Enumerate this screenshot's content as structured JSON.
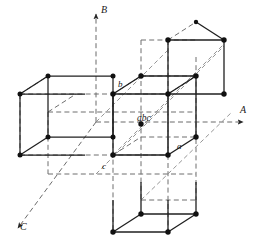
{
  "figure": {
    "type": "crystal-lattice-diagram",
    "background": "#ffffff",
    "line_color": "#1f1f1f",
    "dash_color": "#6b6b6b",
    "vertex_color": "#111111"
  },
  "axes": [
    {
      "id": "A",
      "label": "A",
      "direction": "right",
      "arrow": true
    },
    {
      "id": "B",
      "label": "B",
      "direction": "up",
      "arrow": true
    },
    {
      "id": "C",
      "label": "C",
      "direction": "down-left",
      "arrow": true
    }
  ],
  "point_labels": [
    {
      "id": "a",
      "label": "a",
      "x": 178,
      "y": 146
    },
    {
      "id": "b",
      "label": "b",
      "x": 118,
      "y": 84
    },
    {
      "id": "c",
      "label": "c",
      "x": 102,
      "y": 168
    },
    {
      "id": "abc",
      "label": "abc",
      "x": 136,
      "y": 118
    }
  ],
  "axis_labels": [
    {
      "id": "A",
      "label": "A",
      "x": 240,
      "y": 107
    },
    {
      "id": "B",
      "label": "B",
      "x": 101,
      "y": 7
    },
    {
      "id": "C",
      "label": "C",
      "x": 20,
      "y": 225
    }
  ],
  "cells": [
    {
      "id": "center-cell",
      "role": "origin unit cell"
    },
    {
      "id": "left-cell",
      "role": "cell translated along -A"
    },
    {
      "id": "top-right-cell",
      "role": "cell translated along +B and +A"
    },
    {
      "id": "bottom-cell",
      "role": "cell translated along -B"
    }
  ]
}
